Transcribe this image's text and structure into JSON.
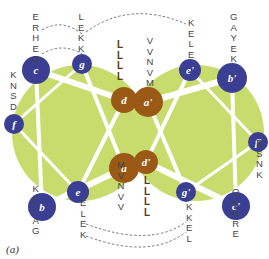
{
  "caption": "(a)",
  "colors": {
    "background_disc": "#c8dc6e",
    "core_residue": "#9a5a16",
    "surface_residue": "#3a3f94",
    "connector": "#ffffff",
    "dashed_link": "#777777"
  },
  "left_helix": {
    "positions": {
      "a": "a",
      "b": "b",
      "c": "c",
      "d": "d",
      "e": "e",
      "f": "f",
      "g": "g"
    },
    "sequences": {
      "c": [
        "E",
        "R",
        "H",
        "E",
        "Q"
      ],
      "g": [
        "L",
        "E",
        "K",
        "K"
      ],
      "d": [
        "L",
        "L",
        "L",
        "L"
      ],
      "f": [
        "K",
        "N",
        "S",
        "D"
      ],
      "b": [
        "K",
        "E",
        "Y",
        "A",
        "G"
      ],
      "e": [
        "E",
        "L",
        "E",
        "K"
      ],
      "a": [
        "M",
        "V",
        "N",
        "V",
        "V"
      ]
    }
  },
  "right_helix": {
    "positions": {
      "a": "a'",
      "b": "b'",
      "c": "c'",
      "d": "d'",
      "e": "e'",
      "f": "f'",
      "g": "g'"
    },
    "sequences": {
      "a": [
        "V",
        "V",
        "N",
        "V",
        "M"
      ],
      "e": [
        "K",
        "E",
        "L",
        "E"
      ],
      "b": [
        "G",
        "A",
        "Y",
        "E",
        "K"
      ],
      "f": [
        "D",
        "S",
        "N",
        "K"
      ],
      "d": [
        "L",
        "L",
        "L",
        "L"
      ],
      "g": [
        "K",
        "K",
        "E",
        "L"
      ],
      "c": [
        "Q",
        "E",
        "H",
        "R",
        "E"
      ]
    }
  }
}
